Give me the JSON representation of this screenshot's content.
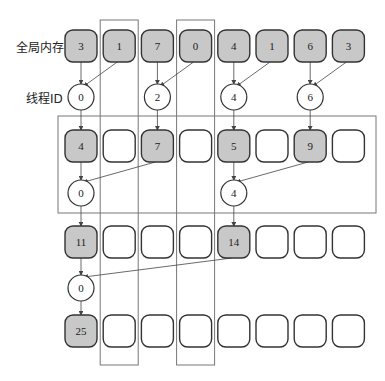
{
  "labels": {
    "global_memory": "全局内存",
    "thread_id": "线程ID"
  },
  "colors": {
    "filled": "#c8c8c8",
    "empty": "#ffffff",
    "stroke": "#333333",
    "frame": "#777777"
  },
  "rows": [
    {
      "y": 30,
      "cells": [
        "3",
        "1",
        "7",
        "0",
        "4",
        "1",
        "6",
        "3"
      ],
      "filled": [
        true,
        true,
        true,
        true,
        true,
        true,
        true,
        true
      ]
    },
    {
      "y": 130,
      "cells": [
        "4",
        "",
        "7",
        "",
        "5",
        "",
        "9",
        ""
      ],
      "filled": [
        true,
        false,
        true,
        false,
        true,
        false,
        true,
        false
      ]
    },
    {
      "y": 226,
      "cells": [
        "11",
        "",
        "",
        "",
        "14",
        "",
        "",
        ""
      ],
      "filled": [
        true,
        false,
        false,
        false,
        true,
        false,
        false,
        false
      ]
    },
    {
      "y": 315,
      "cells": [
        "25",
        "",
        "",
        "",
        "",
        "",
        "",
        ""
      ],
      "filled": [
        true,
        false,
        false,
        false,
        false,
        false,
        false,
        false
      ]
    }
  ],
  "thread_levels": [
    {
      "y": 97,
      "nodes": [
        {
          "col": 0,
          "id": "0",
          "src": [
            0,
            1
          ]
        },
        {
          "col": 2,
          "id": "2",
          "src": [
            2,
            3
          ]
        },
        {
          "col": 4,
          "id": "4",
          "src": [
            4,
            5
          ]
        },
        {
          "col": 6,
          "id": "6",
          "src": [
            6,
            7
          ]
        }
      ]
    },
    {
      "y": 193,
      "nodes": [
        {
          "col": 0,
          "id": "0",
          "src": [
            0,
            2
          ]
        },
        {
          "col": 4,
          "id": "4",
          "src": [
            4,
            6
          ]
        }
      ]
    },
    {
      "y": 288,
      "nodes": [
        {
          "col": 0,
          "id": "0",
          "src": [
            0,
            4
          ]
        }
      ]
    }
  ]
}
